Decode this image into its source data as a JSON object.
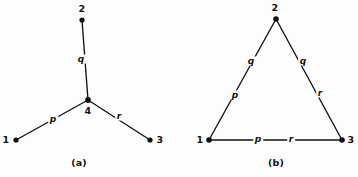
{
  "figure": {
    "background_color": "#fdfdfd",
    "ink_color": "#111111",
    "panels": [
      {
        "id": "panel-a",
        "caption": "(a)",
        "caption_pos": {
          "x": 79,
          "y": 163
        },
        "description": "star / tree topology with central node 4",
        "nodes": [
          {
            "id": "n1",
            "label": "1",
            "x": 16,
            "y": 140,
            "label_x": 6,
            "label_y": 140
          },
          {
            "id": "n2",
            "label": "2",
            "x": 82,
            "y": 20,
            "label_x": 82,
            "label_y": 9
          },
          {
            "id": "n3",
            "label": "3",
            "x": 150,
            "y": 140,
            "label_x": 160,
            "label_y": 140
          },
          {
            "id": "n4",
            "label": "4",
            "x": 88,
            "y": 100,
            "label_x": 88,
            "label_y": 111
          }
        ],
        "edges": [
          {
            "id": "e-q",
            "label": "q",
            "from": "n4",
            "to": "n2",
            "label_x": 81,
            "label_y": 59
          },
          {
            "id": "e-p",
            "label": "p",
            "from": "n1",
            "to": "n4",
            "label_x": 53,
            "label_y": 119
          },
          {
            "id": "e-r",
            "label": "r",
            "from": "n4",
            "to": "n3",
            "label_x": 119,
            "label_y": 116
          }
        ]
      },
      {
        "id": "panel-b",
        "caption": "(b)",
        "caption_pos": {
          "x": 276,
          "y": 163
        },
        "description": "triangle / mesh topology between nodes 1, 2 and 3",
        "nodes": [
          {
            "id": "n1",
            "label": "1",
            "x": 209,
            "y": 140,
            "label_x": 200,
            "label_y": 140
          },
          {
            "id": "n2",
            "label": "2",
            "x": 276,
            "y": 19,
            "label_x": 275,
            "label_y": 8
          },
          {
            "id": "n3",
            "label": "3",
            "x": 342,
            "y": 140,
            "label_x": 351,
            "label_y": 140
          }
        ],
        "edges": [
          {
            "id": "e-left",
            "from": "n1",
            "to": "n2",
            "labels": [
              {
                "text": "q",
                "x": 251,
                "y": 61
              },
              {
                "text": "p",
                "x": 235,
                "y": 95
              }
            ]
          },
          {
            "id": "e-right",
            "from": "n2",
            "to": "n3",
            "labels": [
              {
                "text": "q",
                "x": 303,
                "y": 61
              },
              {
                "text": "r",
                "x": 320,
                "y": 93
              }
            ]
          },
          {
            "id": "e-bottom",
            "from": "n1",
            "to": "n3",
            "labels": [
              {
                "text": "p",
                "x": 258,
                "y": 139
              },
              {
                "text": "r",
                "x": 291,
                "y": 139
              }
            ]
          }
        ]
      }
    ]
  }
}
